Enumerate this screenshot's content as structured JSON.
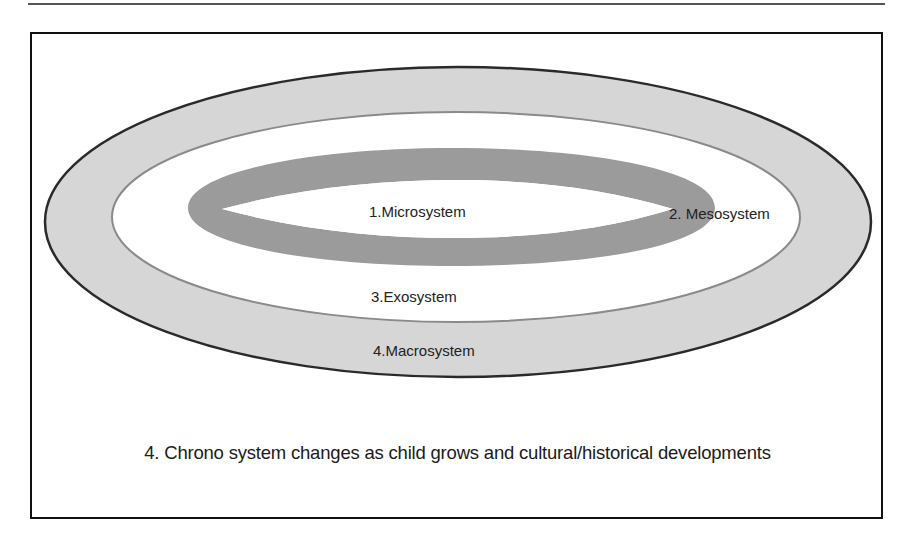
{
  "diagram": {
    "layers": [
      {
        "id": "microsystem",
        "label": "1.Microsystem"
      },
      {
        "id": "mesosystem",
        "label": "2. Mesosystem"
      },
      {
        "id": "exosystem",
        "label": "3.Exosystem"
      },
      {
        "id": "macrosystem",
        "label": "4.Macrosystem"
      }
    ],
    "caption": "4. Chrono system changes as child grows and cultural/historical developments",
    "colors": {
      "macro_fill": "#d6d6d6",
      "macro_stroke": "#2a2a2a",
      "exo_fill": "#ffffff",
      "exo_stroke": "#8a8a8a",
      "micro_ring": "#9b9b9b",
      "frame": "#111111",
      "text": "#222222"
    }
  }
}
